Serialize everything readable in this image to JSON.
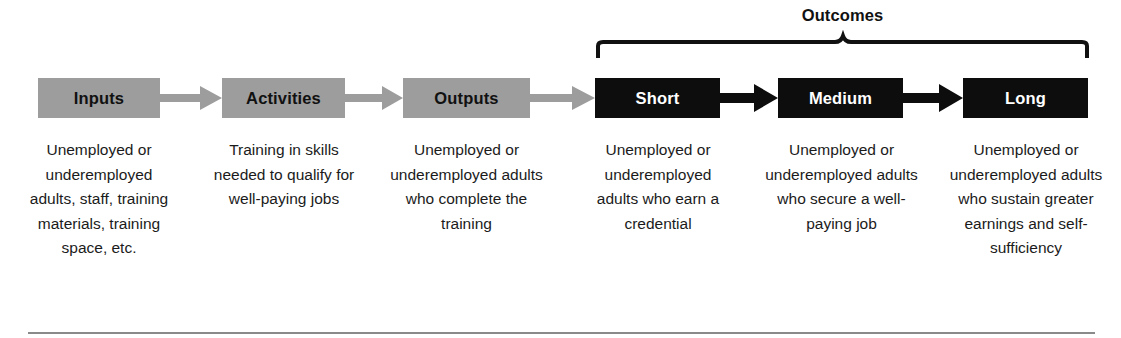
{
  "diagram": {
    "colors": {
      "gray_box": "#9d9d9d",
      "black_box": "#0d0d0d",
      "gray_arrow": "#9d9d9d",
      "black_arrow": "#0d0d0d",
      "text": "#1b1b1b",
      "rule": "#8a8a8a"
    },
    "bracket": {
      "label": "Outcomes",
      "spans": [
        "Short",
        "Medium",
        "Long"
      ]
    },
    "stages": [
      {
        "id": "inputs",
        "label": "Inputs",
        "style": "gray",
        "description": "Unemployed or underemployed adults, staff, training materials, training space, etc."
      },
      {
        "id": "activities",
        "label": "Activities",
        "style": "gray",
        "description": "Training in skills needed to qualify for well-paying jobs"
      },
      {
        "id": "outputs",
        "label": "Outputs",
        "style": "gray",
        "description": "Unemployed or underemployed adults who complete the training"
      },
      {
        "id": "short",
        "label": "Short",
        "style": "black",
        "description": "Unemployed or underemployed adults who earn a credential"
      },
      {
        "id": "medium",
        "label": "Medium",
        "style": "black",
        "description": "Unemployed or underemployed adults who secure a well-paying job"
      },
      {
        "id": "long",
        "label": "Long",
        "style": "black",
        "description": "Unemployed or underemployed adults who sustain greater earnings and self-sufficiency"
      }
    ]
  }
}
